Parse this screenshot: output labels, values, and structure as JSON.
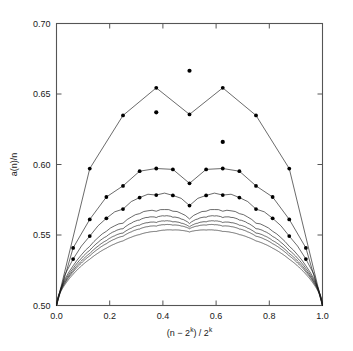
{
  "chart_data": {
    "type": "line",
    "title": "",
    "subtitle": "",
    "xlabel": "(n − 2k) / 2k",
    "xlabel_parts": {
      "pre": "(n − 2",
      "sup1": "k",
      "mid": ") / 2",
      "sup2": "k"
    },
    "ylabel": "a(n)/n",
    "xlim": [
      0.0,
      1.0
    ],
    "ylim": [
      0.5,
      0.7
    ],
    "xticks": [
      0.0,
      0.2,
      0.4,
      0.6,
      0.8,
      1.0
    ],
    "xtick_labels": [
      "0.0",
      "0.2",
      "0.4",
      "0.6",
      "0.8",
      "1.0"
    ],
    "yticks": [
      0.5,
      0.55,
      0.6,
      0.65,
      0.7
    ],
    "ytick_labels": [
      "0.50",
      "0.55",
      "0.60",
      "0.65",
      "0.70"
    ],
    "grid": false,
    "legend": "none",
    "line_color": "#1a1a1a",
    "marker_color": "#000000",
    "marker": "filled-circle",
    "frame": "box",
    "series_count": 8,
    "marker_series_index": 0,
    "annotations": [
      {
        "label": "global maximum",
        "x": 0.5,
        "y": 0.6665
      },
      {
        "label": "left secondary peak",
        "x": 0.375,
        "y": 0.637
      },
      {
        "label": "right secondary peak",
        "x": 0.625,
        "y": 0.616
      },
      {
        "label": "left endpoint",
        "x": 0.0,
        "y": 0.5
      },
      {
        "label": "right endpoint",
        "x": 1.0,
        "y": 0.5
      }
    ],
    "series": [
      {
        "name": "k=3",
        "markers": true,
        "x": [
          0.0,
          0.125,
          0.25,
          0.375,
          0.5,
          0.625,
          0.75,
          0.875,
          1.0
        ],
        "values": [
          0.5,
          0.5635,
          0.6005,
          0.637,
          0.6665,
          0.616,
          0.5855,
          0.5455,
          0.5
        ]
      },
      {
        "name": "k=4",
        "markers": true,
        "x": [
          0.0,
          0.0625,
          0.125,
          0.1875,
          0.25,
          0.3125,
          0.375,
          0.4375,
          0.5,
          0.5625,
          0.625,
          0.6875,
          0.75,
          0.8125,
          0.875,
          0.9375,
          1.0
        ],
        "values": [
          0.5,
          0.5325,
          0.5635,
          0.5795,
          0.5755,
          0.5865,
          0.5965,
          0.6045,
          0.5855,
          0.6005,
          0.5855,
          0.5755,
          0.5655,
          0.5555,
          0.5405,
          0.5215,
          0.5
        ]
      },
      {
        "name": "k=5",
        "markers": true,
        "x": [
          0.0,
          0.0625,
          0.125,
          0.1875,
          0.25,
          0.3125,
          0.375,
          0.4375,
          0.5,
          0.5625,
          0.625,
          0.6875,
          0.75,
          0.8125,
          0.875,
          0.9375,
          1.0
        ],
        "values": [
          0.5,
          0.5295,
          0.5525,
          0.5655,
          0.5715,
          0.5775,
          0.5815,
          0.5835,
          0.5785,
          0.5795,
          0.5755,
          0.5675,
          0.5575,
          0.5455,
          0.5325,
          0.5165,
          0.5
        ]
      },
      {
        "name": "k=6",
        "markers": false,
        "x": [
          0.0,
          0.0625,
          0.125,
          0.1875,
          0.25,
          0.3125,
          0.375,
          0.4375,
          0.5,
          0.5625,
          0.625,
          0.6875,
          0.75,
          0.8125,
          0.875,
          0.9375,
          1.0
        ],
        "values": [
          0.5,
          0.5265,
          0.5455,
          0.5575,
          0.5645,
          0.5685,
          0.5705,
          0.5715,
          0.5705,
          0.5695,
          0.5665,
          0.5605,
          0.5525,
          0.5415,
          0.5295,
          0.5155,
          0.5
        ]
      },
      {
        "name": "k=7",
        "markers": false,
        "x": [
          0.0,
          0.0625,
          0.125,
          0.1875,
          0.25,
          0.3125,
          0.375,
          0.4375,
          0.5,
          0.5625,
          0.625,
          0.6875,
          0.75,
          0.8125,
          0.875,
          0.9375,
          1.0
        ],
        "values": [
          0.5,
          0.5245,
          0.5415,
          0.5525,
          0.5595,
          0.5635,
          0.5655,
          0.5665,
          0.5655,
          0.5645,
          0.5615,
          0.5565,
          0.5485,
          0.5385,
          0.5265,
          0.5145,
          0.5
        ]
      },
      {
        "name": "k=8",
        "markers": false,
        "x": [
          0.0,
          0.0625,
          0.125,
          0.1875,
          0.25,
          0.3125,
          0.375,
          0.4375,
          0.5,
          0.5625,
          0.625,
          0.6875,
          0.75,
          0.8125,
          0.875,
          0.9375,
          1.0
        ],
        "values": [
          0.5,
          0.5235,
          0.5395,
          0.5495,
          0.5555,
          0.5595,
          0.5615,
          0.5625,
          0.5615,
          0.5605,
          0.5575,
          0.5525,
          0.5455,
          0.5365,
          0.5255,
          0.5135,
          0.5
        ]
      },
      {
        "name": "k=9",
        "markers": false,
        "x": [
          0.0,
          0.0625,
          0.125,
          0.1875,
          0.25,
          0.3125,
          0.375,
          0.4375,
          0.5,
          0.5625,
          0.625,
          0.6875,
          0.75,
          0.8125,
          0.875,
          0.9375,
          1.0
        ],
        "values": [
          0.5,
          0.5225,
          0.5375,
          0.5475,
          0.5525,
          0.5565,
          0.5585,
          0.5595,
          0.5585,
          0.5575,
          0.5545,
          0.5505,
          0.5435,
          0.5345,
          0.5245,
          0.5125,
          0.5
        ]
      },
      {
        "name": "k=10",
        "markers": false,
        "x": [
          0.0,
          0.0625,
          0.125,
          0.1875,
          0.25,
          0.3125,
          0.375,
          0.4375,
          0.5,
          0.5625,
          0.625,
          0.6875,
          0.75,
          0.8125,
          0.875,
          0.9375,
          1.0
        ],
        "values": [
          0.5,
          0.5215,
          0.5355,
          0.5445,
          0.5495,
          0.5525,
          0.5545,
          0.555,
          0.5545,
          0.5535,
          0.551,
          0.547,
          0.541,
          0.533,
          0.5235,
          0.512,
          0.5
        ]
      }
    ]
  }
}
